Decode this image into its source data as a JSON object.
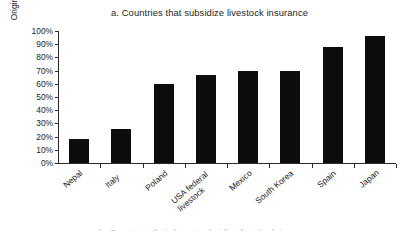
{
  "figure": {
    "title": "a. Countries that subsidize livestock insurance",
    "next_panel_partial_title": "b. Countries that do not subsidize livestock insurance"
  },
  "chart_data": {
    "type": "bar",
    "title": "a. Countries that subsidize livestock insurance",
    "xlabel": "",
    "ylabel": "Original gross premium",
    "categories": [
      "Nepal",
      "Italy",
      "Poland",
      "USA federal livestock",
      "Mexico",
      "South Korea",
      "Spain",
      "Japan"
    ],
    "category_lines": [
      [
        "Nepal"
      ],
      [
        "Italy"
      ],
      [
        "Poland"
      ],
      [
        "USA federal",
        "livestock"
      ],
      [
        "Mexico"
      ],
      [
        "South Korea"
      ],
      [
        "Spain"
      ],
      [
        "Japan"
      ]
    ],
    "values": [
      18,
      26,
      60,
      67,
      70,
      70,
      88,
      96
    ],
    "value_labels": [
      "18%",
      "26%",
      "60%",
      "67%",
      "70%",
      "70%",
      "88%",
      "96%"
    ],
    "ylim": [
      0,
      100
    ],
    "ytick_values": [
      0,
      10,
      20,
      30,
      40,
      50,
      60,
      70,
      80,
      90,
      100
    ],
    "ytick_labels": [
      "0%",
      "10%",
      "20%",
      "30%",
      "40%",
      "50%",
      "60%",
      "70%",
      "80%",
      "90%",
      "100%"
    ],
    "grid": false,
    "legend": null,
    "bar_color": "#0d0d0d",
    "axis_color": "#2b2b2b",
    "background_color": "#ffffff"
  }
}
